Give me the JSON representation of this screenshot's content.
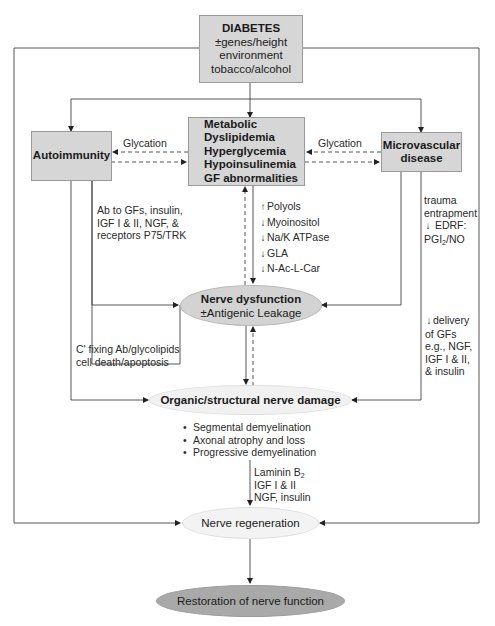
{
  "diagram": {
    "diabetes_box": {
      "title": "DIABETES",
      "lines": [
        "±genes/height",
        "environment",
        "tobacco/alcohol"
      ]
    },
    "autoimmunity_box": {
      "title": "Autoimmunity"
    },
    "metabolic_box": {
      "lines": [
        "Metabolic",
        "Dyslipidemia",
        "Hyperglycemia",
        "Hypoinsulinemia",
        "GF abnormalities"
      ]
    },
    "microvascular_box": {
      "lines": [
        "Microvascular",
        "disease"
      ]
    },
    "glycation_left": "Glycation",
    "glycation_right": "Glycation",
    "autoimmunity_antibodies": [
      "Ab to GFs, insulin,",
      "IGF I & II, NGF, &",
      "receptors P75/TRK"
    ],
    "metabolic_factors": [
      {
        "arrow": "up",
        "label": "Polyols"
      },
      {
        "arrow": "down",
        "label": "Myoinositol"
      },
      {
        "arrow": "down",
        "label": "Na/K ATPase"
      },
      {
        "arrow": "down",
        "label": "GLA"
      },
      {
        "arrow": "down",
        "label": "N-Ac-L-Car"
      }
    ],
    "microvascular_factors": {
      "line1": "trauma",
      "line2": "entrapment",
      "line3": "EDRF:",
      "line4_main": "PGI",
      "line4_sub": "2",
      "line4_rest": "/NO"
    },
    "nerve_dysfunction": {
      "title": "Nerve dysfunction",
      "subtitle": "±Antigenic Leakage"
    },
    "complement_text": [
      "C' fixing Ab/glycolipids",
      "cell death/apoptosis"
    ],
    "delivery_text": [
      "delivery",
      "of GFs",
      "e.g., NGF,",
      "IGF I & II,",
      "& insulin"
    ],
    "organic_damage": {
      "title": "Organic/structural nerve damage"
    },
    "damage_bullets": [
      "Segmental demyelination",
      "Axonal atrophy and loss",
      "Progressive demyelination"
    ],
    "regeneration_factors": {
      "line1_main": "Laminin B",
      "line1_sub": "2",
      "line2": "IGF I & II",
      "line3": "NGF, insulin"
    },
    "nerve_regeneration": {
      "title": "Nerve regeneration"
    },
    "restoration": {
      "title": "Restoration of nerve function"
    },
    "colors": {
      "box_fill": "#d6d6d6",
      "dysfunction_fill": "#d3d3d3",
      "damage_fill": "#f1f1f1",
      "restoration_fill": "#a9a9a9",
      "line": "#333333"
    }
  }
}
